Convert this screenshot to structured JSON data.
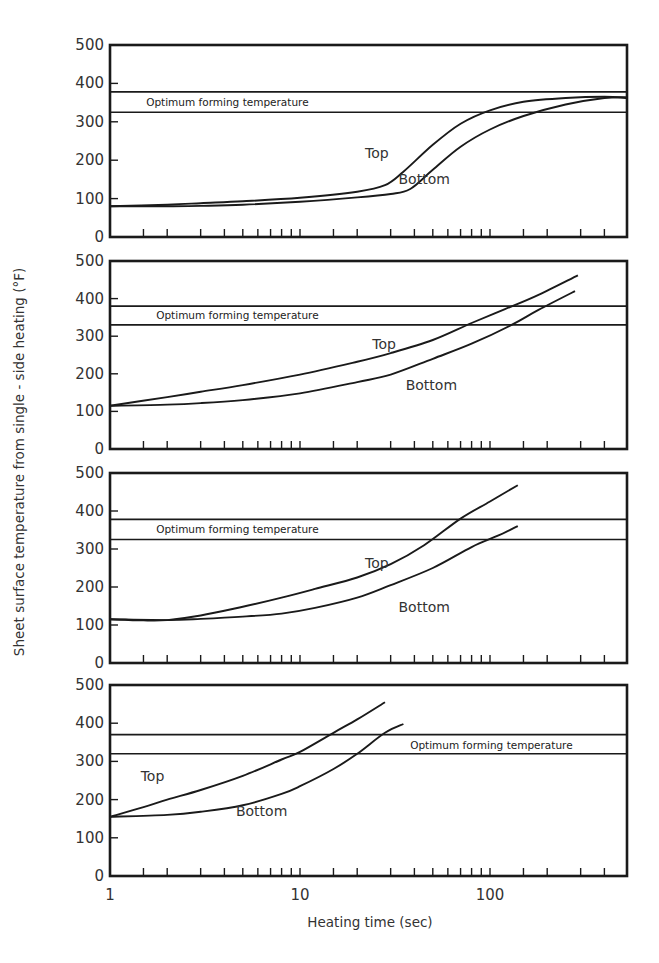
{
  "chart_data": {
    "type": "line",
    "figure": {
      "xlabel": "Heating time (sec)",
      "ylabel": "Sheet surface temperature from single - side heating (°F)",
      "xscale": "log",
      "xlim": [
        1,
        527
      ],
      "x_tick_labels": [
        {
          "value": 1,
          "label": "1"
        },
        {
          "value": 10,
          "label": "10"
        },
        {
          "value": 100,
          "label": "100"
        }
      ],
      "x_minor_ticks": [
        1.5,
        2,
        3,
        4,
        5,
        6,
        7,
        8,
        9,
        15,
        20,
        30,
        40,
        50,
        60,
        70,
        80,
        90,
        150,
        200,
        300,
        400
      ],
      "y_tick_labels": [
        "0",
        "100",
        "200",
        "300",
        "400",
        "500"
      ],
      "y_ticks": [
        0,
        100,
        200,
        300,
        400,
        500
      ],
      "ylim": [
        0,
        500
      ],
      "grid": false,
      "legend": "inline labels"
    },
    "panels": [
      {
        "id": "panel-1",
        "band": {
          "label": "Optimum forming temperature",
          "low": 325,
          "high": 378,
          "label_pos": {
            "t": 1.55,
            "T": 352
          }
        },
        "series": [
          {
            "name": "Top",
            "label_pos": {
              "t": 22,
              "T": 220
            },
            "points": [
              [
                1,
                80
              ],
              [
                2,
                84
              ],
              [
                3,
                88
              ],
              [
                5,
                93
              ],
              [
                10,
                102
              ],
              [
                20,
                118
              ],
              [
                28,
                135
              ],
              [
                35,
                170
              ],
              [
                50,
                240
              ],
              [
                70,
                295
              ],
              [
                100,
                330
              ],
              [
                150,
                352
              ],
              [
                250,
                362
              ],
              [
                400,
                365
              ],
              [
                527,
                362
              ]
            ]
          },
          {
            "name": "Bottom",
            "label_pos": {
              "t": 33,
              "T": 152
            },
            "points": [
              [
                1,
                80
              ],
              [
                2,
                80
              ],
              [
                3,
                81
              ],
              [
                5,
                84
              ],
              [
                10,
                92
              ],
              [
                20,
                103
              ],
              [
                30,
                112
              ],
              [
                38,
                125
              ],
              [
                50,
                175
              ],
              [
                70,
                235
              ],
              [
                100,
                280
              ],
              [
                150,
                315
              ],
              [
                250,
                345
              ],
              [
                400,
                362
              ],
              [
                527,
                364
              ]
            ]
          }
        ]
      },
      {
        "id": "panel-2",
        "band": {
          "label": "Optimum forming temperature",
          "low": 330,
          "high": 380,
          "label_pos": {
            "t": 1.75,
            "T": 356
          }
        },
        "series": [
          {
            "name": "Top",
            "label_pos": {
              "t": 24,
              "T": 278
            },
            "points": [
              [
                1,
                115
              ],
              [
                2,
                138
              ],
              [
                3,
                152
              ],
              [
                5,
                170
              ],
              [
                10,
                198
              ],
              [
                20,
                232
              ],
              [
                30,
                255
              ],
              [
                50,
                290
              ],
              [
                80,
                335
              ],
              [
                120,
                372
              ],
              [
                180,
                410
              ],
              [
                290,
                462
              ]
            ]
          },
          {
            "name": "Bottom",
            "label_pos": {
              "t": 36,
              "T": 170
            },
            "points": [
              [
                1,
                115
              ],
              [
                2,
                118
              ],
              [
                3,
                122
              ],
              [
                5,
                130
              ],
              [
                10,
                148
              ],
              [
                20,
                178
              ],
              [
                30,
                198
              ],
              [
                50,
                240
              ],
              [
                80,
                280
              ],
              [
                130,
                330
              ],
              [
                180,
                370
              ],
              [
                280,
                420
              ]
            ]
          }
        ]
      },
      {
        "id": "panel-3",
        "band": {
          "label": "Optimum forming temperature",
          "low": 325,
          "high": 378,
          "label_pos": {
            "t": 1.75,
            "T": 352
          }
        },
        "series": [
          {
            "name": "Top",
            "label_pos": {
              "t": 22,
              "T": 262
            },
            "points": [
              [
                1,
                115
              ],
              [
                1.5,
                112
              ],
              [
                2,
                113
              ],
              [
                3,
                125
              ],
              [
                5,
                148
              ],
              [
                8,
                172
              ],
              [
                12,
                195
              ],
              [
                20,
                225
              ],
              [
                30,
                260
              ],
              [
                45,
                310
              ],
              [
                70,
                380
              ],
              [
                100,
                425
              ],
              [
                140,
                468
              ]
            ]
          },
          {
            "name": "Bottom",
            "label_pos": {
              "t": 33,
              "T": 148
            },
            "points": [
              [
                1,
                115
              ],
              [
                2,
                113
              ],
              [
                3,
                116
              ],
              [
                5,
                122
              ],
              [
                8,
                130
              ],
              [
                12,
                145
              ],
              [
                20,
                172
              ],
              [
                30,
                205
              ],
              [
                50,
                250
              ],
              [
                80,
                305
              ],
              [
                110,
                335
              ],
              [
                140,
                360
              ]
            ]
          }
        ]
      },
      {
        "id": "panel-4",
        "band": {
          "label": "Optimum forming temperature",
          "low": 320,
          "high": 370,
          "label_pos": {
            "t": 38,
            "T": 342
          }
        },
        "series": [
          {
            "name": "Top",
            "label_pos": {
              "t": 1.45,
              "T": 262
            },
            "points": [
              [
                1,
                155
              ],
              [
                1.5,
                180
              ],
              [
                2,
                200
              ],
              [
                3,
                225
              ],
              [
                5,
                262
              ],
              [
                8,
                305
              ],
              [
                10,
                325
              ],
              [
                15,
                375
              ],
              [
                20,
                410
              ],
              [
                28,
                455
              ]
            ]
          },
          {
            "name": "Bottom",
            "label_pos": {
              "t": 4.6,
              "T": 170
            },
            "points": [
              [
                1,
                155
              ],
              [
                2,
                160
              ],
              [
                3,
                168
              ],
              [
                5,
                185
              ],
              [
                8,
                215
              ],
              [
                10,
                235
              ],
              [
                15,
                280
              ],
              [
                20,
                320
              ],
              [
                28,
                375
              ],
              [
                35,
                398
              ]
            ]
          }
        ]
      }
    ]
  },
  "labels": {
    "xlabel": "Heating time (sec)",
    "ylabel": "Sheet surface temperature from single - side heating (°F)"
  }
}
